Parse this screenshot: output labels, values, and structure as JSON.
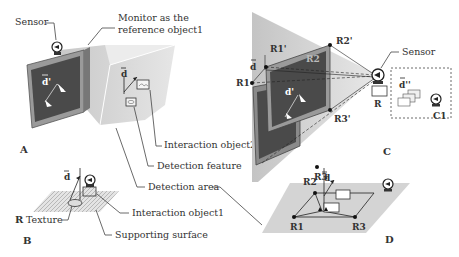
{
  "figure": {
    "panels": [
      {
        "id": "A",
        "label": "A"
      },
      {
        "id": "B",
        "label": "B"
      },
      {
        "id": "C",
        "label": "C"
      },
      {
        "id": "D",
        "label": "D"
      }
    ],
    "callouts": {
      "sensor_a": "Sensor",
      "monitor_line1": "Monitor as the",
      "monitor_line2": "reference object1",
      "interaction_object2": "Interaction object2",
      "detection_feature": "Detection feature",
      "detection_area": "Detection area",
      "interaction_object1": "Interaction object1",
      "texture": "Texture",
      "supporting_surface": "Supporting surface",
      "sensor_c": "Sensor"
    },
    "symbols": {
      "d": "d",
      "d_prime": "d'",
      "d_double_prime": "d''",
      "R": "R",
      "R1": "R1",
      "R2": "R2",
      "R3": "R3",
      "R1_prime": "R1'",
      "R2_prime": "R2'",
      "R3_prime": "R3'",
      "C1": "C1"
    },
    "colors": {
      "monitor_screen": "#4a4a4a",
      "monitor_frame": "#9a9a9a",
      "detection_area": "#d4d4d4",
      "texture": "#c8c8c8",
      "line": "#333333"
    }
  }
}
